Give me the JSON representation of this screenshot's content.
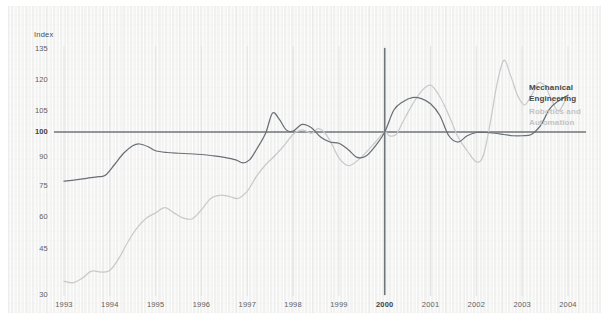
{
  "chart_data": {
    "type": "line",
    "title": "",
    "xlabel": "",
    "ylabel": "Index",
    "ylim": [
      30,
      138
    ],
    "xlim": [
      1993,
      2004.4
    ],
    "grid": true,
    "legend_position": "right",
    "baseline": {
      "value": 100,
      "label": "100",
      "bold": true
    },
    "reference_line_x": {
      "value": 2000,
      "label": "2000",
      "bold": true
    },
    "ytick_labels": [
      "135",
      "120",
      "105",
      "100",
      "90",
      "75",
      "60",
      "45",
      "30"
    ],
    "ytick_values": [
      135,
      120,
      105,
      100,
      90,
      75,
      60,
      45,
      30
    ],
    "xtick_labels": [
      "1993",
      "1994",
      "1995",
      "1996",
      "1997",
      "1998",
      "1999",
      "2000",
      "2001",
      "2002",
      "2003",
      "2004"
    ],
    "xtick_values": [
      1993,
      1994,
      1995,
      1996,
      1997,
      1998,
      1999,
      2000,
      2001,
      2002,
      2003,
      2004
    ],
    "series": [
      {
        "name": "Mechanical Engineering",
        "color": "#6a7076",
        "x": [
          1993.0,
          1993.25,
          1993.5,
          1993.75,
          1993.9,
          1994.1,
          1994.3,
          1994.5,
          1994.65,
          1994.85,
          1995.0,
          1995.25,
          1995.5,
          1995.75,
          1996.0,
          1996.25,
          1996.5,
          1996.75,
          1996.9,
          1997.05,
          1997.2,
          1997.4,
          1997.55,
          1997.7,
          1997.85,
          1998.0,
          1998.2,
          1998.4,
          1998.6,
          1998.8,
          1999.0,
          1999.2,
          1999.4,
          1999.6,
          1999.8,
          2000.0,
          2000.2,
          2000.4,
          2000.6,
          2000.8,
          2001.0,
          2001.2,
          2001.4,
          2001.6,
          2001.8,
          2002.0,
          2002.2,
          2002.4,
          2002.6,
          2002.8,
          2003.0,
          2003.2,
          2003.4,
          2003.6,
          2003.8,
          2004.0
        ],
        "y": [
          77.5,
          78.2,
          79.0,
          79.8,
          80.5,
          86.0,
          91.5,
          94.5,
          95.2,
          94.0,
          92.5,
          91.8,
          91.5,
          91.3,
          91.0,
          90.5,
          89.8,
          88.5,
          87.0,
          88.5,
          93.0,
          99.5,
          104.5,
          103.0,
          100.5,
          100.2,
          101.8,
          101.0,
          98.0,
          96.0,
          95.5,
          93.0,
          89.8,
          90.5,
          94.5,
          100.0,
          105.5,
          109.5,
          111.5,
          111.0,
          108.5,
          104.0,
          98.5,
          96.0,
          98.5,
          99.8,
          99.8,
          99.5,
          99.0,
          98.5,
          98.5,
          99.0,
          101.5,
          106.0,
          110.0,
          112.5
        ]
      },
      {
        "name": "Robotics and Automation",
        "color": "#c8cacc",
        "x": [
          1993.0,
          1993.2,
          1993.4,
          1993.6,
          1993.8,
          1994.0,
          1994.2,
          1994.4,
          1994.6,
          1994.8,
          1995.0,
          1995.2,
          1995.4,
          1995.6,
          1995.8,
          1996.0,
          1996.2,
          1996.4,
          1996.6,
          1996.8,
          1997.0,
          1997.2,
          1997.4,
          1997.6,
          1997.8,
          1998.0,
          1998.2,
          1998.4,
          1998.55,
          1998.7,
          1998.85,
          1999.0,
          1999.2,
          1999.4,
          1999.6,
          1999.8,
          2000.0,
          2000.1,
          2000.25,
          2000.4,
          2000.6,
          2000.8,
          2001.0,
          2001.2,
          2001.4,
          2001.6,
          2001.8,
          2002.0,
          2002.15,
          2002.3,
          2002.45,
          2002.6,
          2002.75,
          2002.9,
          2003.05,
          2003.2,
          2003.35,
          2003.5,
          2003.65,
          2003.8,
          2004.0
        ],
        "y": [
          34.5,
          34.0,
          35.5,
          37.8,
          37.5,
          38.0,
          42.0,
          48.5,
          55.0,
          59.5,
          62.0,
          64.5,
          62.0,
          59.5,
          59.2,
          63.5,
          69.0,
          70.5,
          70.0,
          69.0,
          72.5,
          80.0,
          86.0,
          90.5,
          94.5,
          99.0,
          100.5,
          99.5,
          100.8,
          99.5,
          95.0,
          89.5,
          85.5,
          88.0,
          92.0,
          96.0,
          100.0,
          98.5,
          99.0,
          102.5,
          108.0,
          114.5,
          117.5,
          112.0,
          104.0,
          98.0,
          92.5,
          87.5,
          90.5,
          102.0,
          118.0,
          129.5,
          122.0,
          112.5,
          108.0,
          112.5,
          118.5,
          117.0,
          110.0,
          105.0,
          113.0
        ]
      }
    ]
  },
  "legend": {
    "mechanical_engineering": "Mechanical\nEngineering",
    "mechanical_engineering_line1": "Mechanical",
    "mechanical_engineering_line2": "Engineering",
    "robotics_line1": "Robotics and",
    "robotics_line2": "Automation"
  },
  "colors": {
    "mechanical": "#6a7076",
    "robotics": "#c8cacc",
    "axis": "#5d6166",
    "background": "#f4f4f3"
  }
}
